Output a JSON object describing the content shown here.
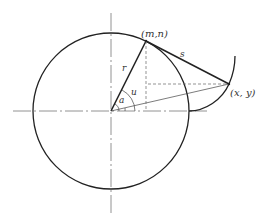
{
  "diagram": {
    "type": "circle involute construction",
    "labels": {
      "point_tangent": "(m,n)",
      "point_curve": "(x, y)",
      "radius": "r",
      "arc_length": "s",
      "angle_u": "u",
      "angle_a": "a"
    },
    "colors": {
      "stroke": "#222222",
      "axis": "#555555",
      "dashed": "#666666",
      "background": "#ffffff"
    }
  }
}
